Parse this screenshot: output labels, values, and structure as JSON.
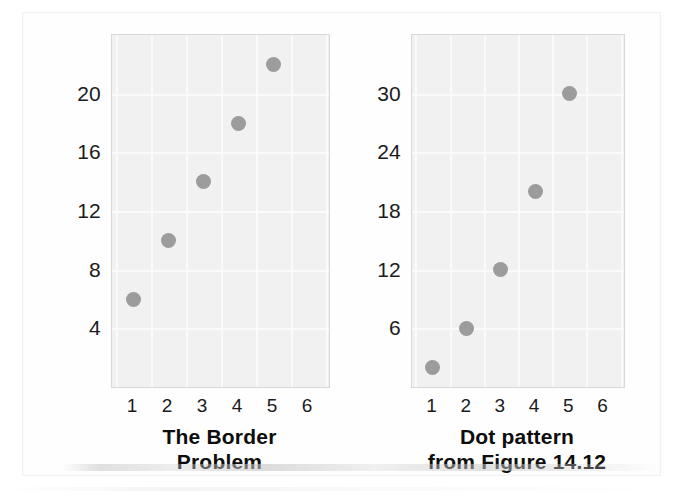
{
  "figure": {
    "background_color": "#ffffff",
    "plot_fill_color": "#f1f1f1",
    "grid_color": "#fafafa",
    "dot_color": "#9c9c9c",
    "axis_text_color": "#1b1b1b"
  },
  "chart_data": [
    {
      "type": "scatter",
      "title": "The Border Problem",
      "caption_line1": "The Border",
      "caption_line2": "Problem",
      "xlabel": "",
      "ylabel": "",
      "x": [
        1,
        2,
        3,
        4,
        5
      ],
      "values": [
        6,
        10,
        14,
        18,
        22
      ],
      "xticks": [
        "1",
        "2",
        "3",
        "4",
        "5",
        "6"
      ],
      "xtick_values": [
        1,
        2,
        3,
        4,
        5,
        6
      ],
      "yticks": [
        "4",
        "8",
        "12",
        "16",
        "20"
      ],
      "ytick_values": [
        4,
        8,
        12,
        16,
        20
      ],
      "xlim": [
        0.4,
        6.6
      ],
      "ylim": [
        0,
        24
      ],
      "grid": true,
      "legend": "none"
    },
    {
      "type": "scatter",
      "title": "Dot pattern from Figure 14.12",
      "caption_line1": "Dot pattern",
      "caption_line2": "from Figure 14.12",
      "xlabel": "",
      "ylabel": "",
      "x": [
        1,
        2,
        3,
        4,
        5
      ],
      "values": [
        2,
        6,
        12,
        20,
        30
      ],
      "xticks": [
        "1",
        "2",
        "3",
        "4",
        "5",
        "6"
      ],
      "xtick_values": [
        1,
        2,
        3,
        4,
        5,
        6
      ],
      "yticks": [
        "6",
        "12",
        "18",
        "24",
        "30"
      ],
      "ytick_values": [
        6,
        12,
        18,
        24,
        30
      ],
      "xlim": [
        0.4,
        6.6
      ],
      "ylim": [
        0,
        36
      ],
      "grid": true,
      "legend": "none"
    }
  ]
}
